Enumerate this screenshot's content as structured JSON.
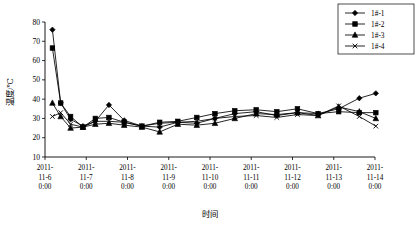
{
  "chart_data": {
    "type": "line",
    "title": "",
    "xlabel": "时间",
    "ylabel": "温度/℃",
    "ylim": [
      10,
      80
    ],
    "ytick_step": 10,
    "yticks": [
      "10",
      "20",
      "30",
      "40",
      "50",
      "60",
      "70",
      "80"
    ],
    "grid": false,
    "legend_position": "top-right",
    "xtick_labels": [
      [
        "2011-",
        "11-6",
        "0:00"
      ],
      [
        "2011-",
        "11-7",
        "0:00"
      ],
      [
        "2011-",
        "11-8",
        "0:00"
      ],
      [
        "2011-",
        "11-9",
        "0:00"
      ],
      [
        "2011-",
        "11-10",
        "0:00"
      ],
      [
        "2011-",
        "11-11",
        "0:00"
      ],
      [
        "2011-",
        "11-12",
        "0:00"
      ],
      [
        "2011-",
        "11-13",
        "0:00"
      ],
      [
        "2011-",
        "11-14",
        "0:00"
      ]
    ],
    "x_days": [
      0,
      1,
      2,
      3,
      4,
      5,
      6,
      7,
      8
    ],
    "series": [
      {
        "name": "1#-1",
        "marker": "diamond",
        "x": [
          0.18,
          0.38,
          0.62,
          0.92,
          1.22,
          1.55,
          1.92,
          2.35,
          2.78,
          3.22,
          3.68,
          4.12,
          4.6,
          5.12,
          5.62,
          6.12,
          6.62,
          7.12,
          7.62,
          8.02
        ],
        "y": [
          76.0,
          38.0,
          29.5,
          26.0,
          28.5,
          37.0,
          29.0,
          26.0,
          25.5,
          28.0,
          27.5,
          30.0,
          32.5,
          33.5,
          31.5,
          33.0,
          32.5,
          35.0,
          40.5,
          43.0
        ]
      },
      {
        "name": "1#-2",
        "marker": "square",
        "x": [
          0.18,
          0.38,
          0.62,
          0.92,
          1.22,
          1.55,
          1.92,
          2.35,
          2.78,
          3.22,
          3.68,
          4.12,
          4.6,
          5.12,
          5.62,
          6.12,
          6.62,
          7.12,
          7.62,
          8.02
        ],
        "y": [
          66.5,
          38.0,
          31.0,
          25.5,
          30.0,
          30.5,
          28.0,
          26.0,
          28.0,
          28.5,
          30.5,
          32.5,
          34.0,
          34.5,
          33.5,
          35.0,
          32.5,
          33.5,
          33.0,
          33.0
        ]
      },
      {
        "name": "1#-3",
        "marker": "triangle",
        "x": [
          0.18,
          0.38,
          0.62,
          0.92,
          1.22,
          1.55,
          1.92,
          2.35,
          2.78,
          3.22,
          3.68,
          4.12,
          4.6,
          5.12,
          5.62,
          6.12,
          6.62,
          7.12,
          7.62,
          8.02
        ],
        "y": [
          38.0,
          31.0,
          25.0,
          25.5,
          27.0,
          27.5,
          26.5,
          25.5,
          23.0,
          27.0,
          26.5,
          27.5,
          30.0,
          32.5,
          32.0,
          33.0,
          31.5,
          36.0,
          33.5,
          30.0
        ]
      },
      {
        "name": "1#-4",
        "marker": "x",
        "x": [
          0.18,
          0.38,
          0.62,
          0.92,
          1.22,
          1.55,
          1.92,
          2.35,
          2.78,
          3.22,
          3.68,
          4.12,
          4.6,
          5.12,
          5.62,
          6.12,
          6.62,
          7.12,
          7.62,
          8.02
        ],
        "y": [
          31.0,
          33.0,
          27.0,
          25.5,
          28.5,
          28.5,
          28.0,
          26.0,
          27.5,
          28.0,
          28.5,
          30.0,
          31.0,
          31.5,
          30.5,
          32.0,
          31.5,
          36.5,
          31.0,
          26.0
        ]
      }
    ]
  },
  "legend": {
    "items": [
      {
        "label": "1#-1",
        "marker": "diamond"
      },
      {
        "label": "1#-2",
        "marker": "square"
      },
      {
        "label": "1#-3",
        "marker": "triangle"
      },
      {
        "label": "1#-4",
        "marker": "x"
      }
    ]
  }
}
